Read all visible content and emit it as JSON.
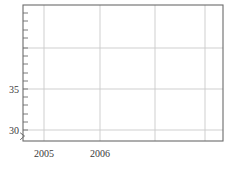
{
  "chart_data": {
    "type": "line",
    "title": "",
    "subtitle": "",
    "xlabel": "",
    "ylabel": "",
    "series": [],
    "x_tick_labels": [
      "2005",
      "2006"
    ],
    "x_tick_values": [
      2005,
      2006
    ],
    "y_tick_labels": [
      "35",
      "30"
    ],
    "y_tick_values": [
      35,
      30
    ],
    "xlim": [
      2004.57,
      2008.8
    ],
    "ylim": [
      29.0,
      41.3
    ],
    "grid": true,
    "legend": "none",
    "axis_break": "y-axis-break-mark-at-bottom"
  },
  "axes": {
    "frame_color": "#6b6b6b",
    "grid_color": "#c9c9c9",
    "minor_tick_color": "#6b6b6b",
    "label_color": "#3a3a3a",
    "background_color": "#ffffff"
  },
  "geometry": {
    "plot_left": 23,
    "plot_right": 223,
    "plot_top": 5,
    "plot_bottom": 141,
    "vertical_gridlines_x": [
      44,
      100,
      155,
      205
    ],
    "horizontal_gridlines_y": [
      48,
      89,
      130
    ],
    "y_minor_ticks_y": [
      13,
      21,
      30,
      38,
      48,
      56,
      64,
      73,
      81,
      89,
      97,
      105,
      114,
      122,
      130
    ],
    "y_label_positions": [
      {
        "label": "35",
        "x": 19,
        "y": 93
      },
      {
        "label": "30",
        "x": 19,
        "y": 134
      }
    ],
    "x_label_positions": [
      {
        "label": "2005",
        "x": 44,
        "y": 157
      },
      {
        "label": "2006",
        "x": 100,
        "y": 157
      }
    ]
  }
}
